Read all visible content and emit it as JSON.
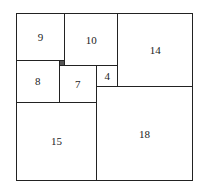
{
  "diagram": {
    "units": {
      "width": 33,
      "height": 32
    },
    "squares": [
      {
        "label": "9",
        "x": 0,
        "y": 0,
        "size": 9
      },
      {
        "label": "10",
        "x": 9,
        "y": 0,
        "size": 10
      },
      {
        "label": "14",
        "x": 19,
        "y": 0,
        "size": 14
      },
      {
        "label": "8",
        "x": 0,
        "y": 9,
        "size": 8
      },
      {
        "label": "",
        "x": 8,
        "y": 9,
        "size": 1
      },
      {
        "label": "7",
        "x": 8,
        "y": 10,
        "size": 7
      },
      {
        "label": "4",
        "x": 15,
        "y": 10,
        "size": 4
      },
      {
        "label": "18",
        "x": 15,
        "y": 14,
        "size": 18
      },
      {
        "label": "15",
        "x": 0,
        "y": 17,
        "size": 15
      }
    ]
  }
}
